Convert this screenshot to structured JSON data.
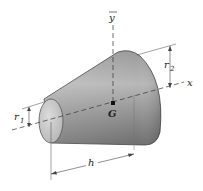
{
  "diagram": {
    "labels": {
      "y_axis": "y",
      "x_axis": "x",
      "centroid": "G",
      "small_radius": "r",
      "small_radius_sub": "1",
      "large_radius": "r",
      "large_radius_sub": "2",
      "height": "h"
    },
    "colors": {
      "body_light": "#d8d8d8",
      "body_dark": "#7a7a7a",
      "end_face": "#c4c4c4",
      "lines": "#333333"
    }
  }
}
